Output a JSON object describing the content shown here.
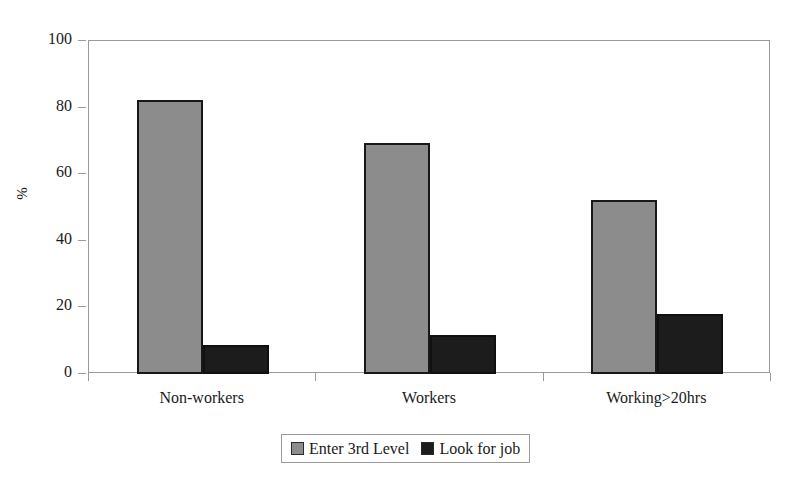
{
  "chart_data": {
    "type": "bar",
    "title": "",
    "subtitle": "",
    "xlabel": "",
    "ylabel": "%",
    "ylim": [
      0,
      100
    ],
    "yticks": [
      0,
      20,
      40,
      60,
      80,
      100
    ],
    "ytick_labels": [
      "0",
      "20",
      "40",
      "60",
      "80",
      "100"
    ],
    "grid": false,
    "legend_position": "bottom",
    "categories": [
      "Non-workers",
      "Workers",
      "Working>20hrs"
    ],
    "series": [
      {
        "name": "Enter 3rd Level",
        "color": "#8c8c8c",
        "values": [
          82.2,
          69.4,
          52.2
        ]
      },
      {
        "name": "Look for job",
        "color": "#1c1c1c",
        "values": [
          8.7,
          11.7,
          18.0
        ]
      }
    ]
  },
  "legend": {
    "entries": [
      {
        "label": "Enter 3rd Level",
        "swatch": "gray-swatch-icon"
      },
      {
        "label": "Look for job",
        "swatch": "black-swatch-icon"
      }
    ]
  }
}
